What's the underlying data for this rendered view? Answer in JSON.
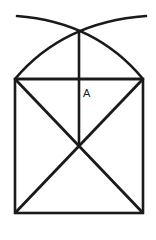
{
  "figure": {
    "background_color": "#ffffff",
    "stroke_color": "#1a1a1a",
    "canvas": {
      "width": 156,
      "height": 240
    },
    "labels": [
      {
        "id": "A",
        "text": "A",
        "x": 83,
        "y": 97
      }
    ],
    "points": {
      "apex": {
        "x": 79,
        "y": 30
      },
      "top_left": {
        "x": 15,
        "y": 79
      },
      "top_right": {
        "x": 143,
        "y": 79
      },
      "bottom_left": {
        "x": 15,
        "y": 213
      },
      "bottom_right": {
        "x": 143,
        "y": 213
      },
      "center": {
        "x": 79,
        "y": 146
      },
      "arc_left_start": {
        "x": 17,
        "y": 16
      },
      "arc_right_start": {
        "x": 146,
        "y": 16
      }
    },
    "shapes": {
      "rectangle": {
        "name": "square-outline",
        "x": 15,
        "y": 79,
        "width": 128,
        "height": 134,
        "stroke_width": 2.6
      },
      "top_edge": {
        "name": "square-top-edge",
        "d": "M 15 79 L 143 79",
        "stroke_width": 2.6
      },
      "vertical_axis": {
        "name": "vertical-axis-line",
        "d": "M 79 30 L 79 146",
        "stroke_width": 2.6
      },
      "diagonal_upper_left": {
        "name": "upper-left-diagonal",
        "d": "M 15 79 L 79 146",
        "stroke_width": 2.8
      },
      "diagonal_upper_right": {
        "name": "upper-right-diagonal",
        "d": "M 143 79 L 79 146",
        "stroke_width": 2.8
      },
      "diagonal_lower_left": {
        "name": "lower-left-diagonal",
        "d": "M 15 213 L 79 146",
        "stroke_width": 2.8
      },
      "diagonal_lower_right": {
        "name": "lower-right-diagonal",
        "d": "M 143 213 L 79 146",
        "stroke_width": 2.8
      },
      "arc_left": {
        "name": "left-construction-arc",
        "d": "M 17 16 Q 96 22 143 79",
        "stroke_width": 2.6
      },
      "arc_right": {
        "name": "right-construction-arc",
        "d": "M 146 16 Q 63 22 15 79",
        "stroke_width": 2.6
      }
    }
  }
}
